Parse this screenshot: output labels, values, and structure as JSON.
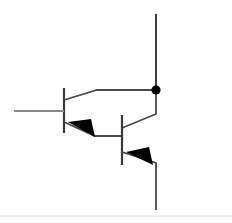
{
  "diagram": {
    "type": "circuit-schematic",
    "canvas": {
      "width": 232,
      "height": 223,
      "background": "#ffffff"
    },
    "colors": {
      "wire": "#3a3a3a",
      "wire_light": "#808080",
      "fill": "#000000",
      "background": "#ffffff",
      "faint_rule": "#d8d8d8"
    },
    "stroke_widths": {
      "wire": 2.0,
      "thin": 1.6,
      "rule": 1.0
    }
  },
  "components": {
    "transistor_q1": {
      "name": "Q1",
      "role": "input-transistor",
      "base_bar": {
        "x": 64,
        "y1": 88,
        "y2": 133
      },
      "base_lead": {
        "x1": 14,
        "y1": 111,
        "x2": 64,
        "y2": 111
      },
      "collector_lead": [
        {
          "x": 64,
          "y": 100
        },
        {
          "x": 97,
          "y": 90
        },
        {
          "x": 156,
          "y": 90
        }
      ],
      "emitter_lead": [
        {
          "x": 64,
          "y": 122
        },
        {
          "x": 95,
          "y": 136
        },
        {
          "x": 122,
          "y": 136
        }
      ],
      "emitter_arrow": [
        {
          "x": 68,
          "y": 122
        },
        {
          "x": 95,
          "y": 137
        },
        {
          "x": 91,
          "y": 119
        }
      ]
    },
    "transistor_q2": {
      "name": "Q2",
      "role": "output-transistor",
      "base_bar": {
        "x": 122,
        "y1": 115,
        "y2": 165
      },
      "collector_lead": [
        {
          "x": 122,
          "y": 128
        },
        {
          "x": 156,
          "y": 114
        },
        {
          "x": 156,
          "y": 90
        }
      ],
      "emitter_lead": [
        {
          "x": 122,
          "y": 152
        },
        {
          "x": 156,
          "y": 163
        },
        {
          "x": 156,
          "y": 210
        }
      ],
      "emitter_arrow": [
        {
          "x": 126,
          "y": 152
        },
        {
          "x": 153,
          "y": 165
        },
        {
          "x": 149,
          "y": 147
        }
      ]
    }
  },
  "wires": {
    "supply_rail": {
      "x": 156,
      "y1": 14,
      "y2": 90
    },
    "output_rail": {
      "x": 156,
      "y1": 163,
      "y2": 210
    },
    "input_lead": {
      "x1": 14,
      "y1": 111,
      "x2": 64,
      "y2": 111
    }
  },
  "junctions": [
    {
      "name": "collector-node",
      "x": 156,
      "y": 90,
      "radius": 4.6
    }
  ],
  "decorations": {
    "bottom_rule": {
      "x1": 0,
      "y1": 216,
      "x2": 232,
      "y2": 216
    }
  }
}
